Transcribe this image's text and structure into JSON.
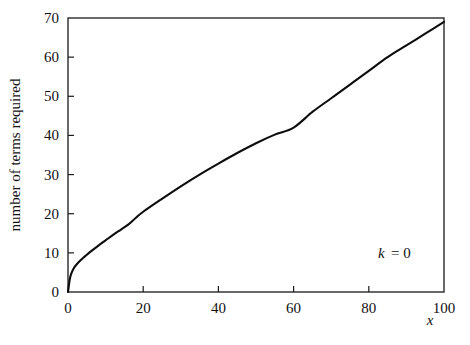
{
  "figure": {
    "background_color": "#ffffff",
    "ink_color": "#111111",
    "frame_color": "#1a1a1a",
    "curve_color": "#0d0d0d"
  },
  "annotation": {
    "symbol": "k",
    "equals_value": "= 0"
  },
  "chart_data": {
    "type": "line",
    "title": "",
    "subtitle": "",
    "xlabel": "x",
    "ylabel": "number of terms required",
    "xlim": [
      0,
      100
    ],
    "ylim": [
      0,
      70
    ],
    "xticks": [
      0,
      20,
      40,
      60,
      80,
      100
    ],
    "xtick_labels": [
      "0",
      "20",
      "40",
      "60",
      "80",
      "100"
    ],
    "yticks": [
      0,
      10,
      20,
      30,
      40,
      50,
      60,
      70
    ],
    "ytick_labels": [
      "0",
      "10",
      "20",
      "30",
      "40",
      "50",
      "60",
      "70"
    ],
    "grid": false,
    "legend": null,
    "legend_position": "none",
    "annotations": [
      {
        "text": "k = 0",
        "x": 88,
        "y": 10
      }
    ],
    "series": [
      {
        "name": "number of terms required",
        "x": [
          0,
          0.5,
          1,
          1.5,
          2,
          3,
          4,
          5,
          6,
          8,
          10,
          12,
          14,
          16,
          18,
          20,
          25,
          30,
          35,
          40,
          45,
          50,
          55,
          60,
          65,
          70,
          75,
          80,
          85,
          90,
          95,
          100
        ],
        "values": [
          0,
          3.4,
          5.0,
          6.0,
          6.7,
          7.8,
          8.7,
          9.5,
          10.3,
          11.8,
          13.2,
          14.6,
          15.9,
          17.2,
          18.9,
          20.5,
          23.8,
          27.0,
          30.0,
          32.8,
          35.5,
          38.0,
          40.2,
          42.0,
          46.0,
          49.5,
          53.0,
          56.5,
          60.0,
          63.0,
          66.0,
          69.0
        ]
      }
    ]
  },
  "geometry": {
    "plot_left": 68,
    "plot_right": 444,
    "plot_top": 18,
    "plot_bottom": 292
  }
}
